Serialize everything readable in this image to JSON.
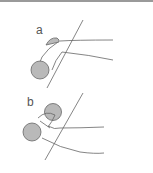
{
  "figure": {
    "panels": [
      {
        "label": "a",
        "description": "forearm resting with dumbbell, wrist neutral"
      },
      {
        "label": "b",
        "description": "hand gripping dumbbell, wrist flexed"
      }
    ],
    "colors": {
      "line": "#666666",
      "weight_fill": "#b9b9b9",
      "rule": "#9a9a9a"
    }
  }
}
